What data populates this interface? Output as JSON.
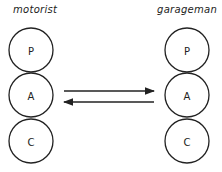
{
  "diagram": {
    "left": {
      "title": "motorist",
      "states": [
        "P",
        "A",
        "C"
      ]
    },
    "right": {
      "title": "garageman",
      "states": [
        "P",
        "A",
        "C"
      ]
    },
    "arrows": [
      {
        "from": "motorist.A",
        "to": "garageman.A",
        "direction": "right"
      },
      {
        "from": "garageman.A",
        "to": "motorist.A",
        "direction": "left"
      }
    ]
  }
}
